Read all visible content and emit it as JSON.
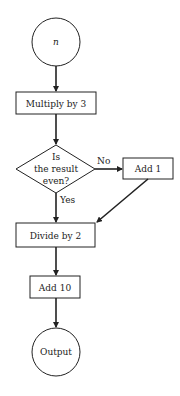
{
  "flowchart": {
    "start": {
      "label": "n",
      "shape": "circle"
    },
    "steps": [
      {
        "id": "multiply",
        "label": "Multiply by 3",
        "shape": "rectangle"
      },
      {
        "id": "decision",
        "label_lines": [
          "Is",
          "the result",
          "even?"
        ],
        "shape": "diamond"
      },
      {
        "id": "add1",
        "label": "Add 1",
        "shape": "rectangle"
      },
      {
        "id": "divide",
        "label": "Divide by 2",
        "shape": "rectangle"
      },
      {
        "id": "add10",
        "label": "Add 10",
        "shape": "rectangle"
      }
    ],
    "end": {
      "label": "Output",
      "shape": "circle"
    },
    "edges": {
      "no_label": "No",
      "yes_label": "Yes"
    },
    "colors": {
      "stroke": "#222222",
      "background": "#ffffff"
    }
  }
}
